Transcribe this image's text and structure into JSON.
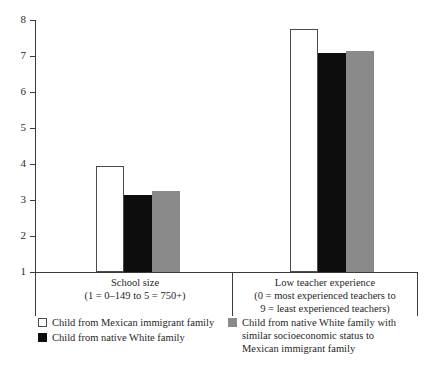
{
  "chart_data": {
    "type": "bar",
    "title": "",
    "subtitle": "",
    "xlabel": "",
    "ylabel": "",
    "ylim": [
      1,
      8
    ],
    "ytick_labels": [
      "8",
      "7",
      "6",
      "5",
      "4",
      "3",
      "2",
      "1"
    ],
    "ytick_values": [
      8,
      7,
      6,
      5,
      4,
      3,
      2,
      1
    ],
    "grid": false,
    "legend_position": "bottom",
    "categories": [
      "School size",
      "Low teacher experience"
    ],
    "category_captions": [
      {
        "title": "School size",
        "sub_lines": [
          "(1 = 0–149 to 5 = 750+)"
        ]
      },
      {
        "title": "Low teacher experience",
        "sub_lines": [
          "(0 = most experienced teachers to",
          "9 = least experienced teachers)"
        ]
      }
    ],
    "series": [
      {
        "name": "Child from Mexican immigrant family",
        "color": "#ffffff",
        "edge_color": "#4a4a4a",
        "values": [
          3.95,
          7.75
        ]
      },
      {
        "name": "Child from native White family",
        "color": "#0d0d0d",
        "edge_color": "#0d0d0d",
        "values": [
          3.15,
          7.08
        ]
      },
      {
        "name": "Child from native White family with similar socioeconomic status to Mexican immigrant family",
        "color": "#8a8a8a",
        "edge_color": "#8a8a8a",
        "values": [
          3.25,
          7.14
        ]
      }
    ]
  },
  "legend": {
    "items": [
      {
        "swatch": "white",
        "lines": [
          "Child from Mexican immigrant family"
        ]
      },
      {
        "swatch": "black",
        "lines": [
          "Child from native White family"
        ]
      },
      {
        "swatch": "gray",
        "lines": [
          "Child from native White family with",
          "similar socioeconomic status to",
          "Mexican immigrant family"
        ]
      }
    ]
  }
}
